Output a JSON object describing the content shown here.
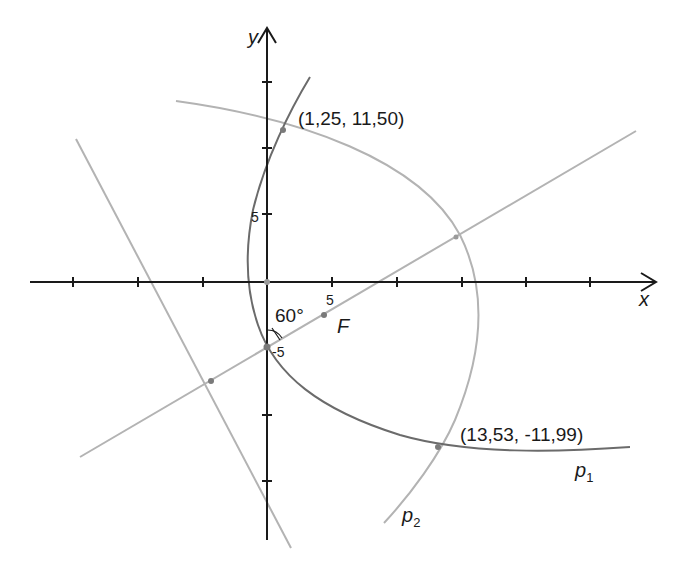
{
  "axes": {
    "x_label": "x",
    "y_label": "y",
    "tick_label_x_5": "5",
    "tick_label_y_5": "5",
    "tick_label_y_neg5": "-5"
  },
  "annotations": {
    "angle": "60°",
    "focus": "F",
    "point_top": "(1,25, 11,50)",
    "point_bottom": "(13,53, -11,99)",
    "curve1_base": "p",
    "curve1_sub": "1",
    "curve2_base": "p",
    "curve2_sub": "2"
  },
  "colors": {
    "axis": "#1a1a1a",
    "curve_p1": "#6b6b6b",
    "curve_p2": "#b3b3b3",
    "lines": "#b3b3b3",
    "points": "#7a7a7a"
  }
}
